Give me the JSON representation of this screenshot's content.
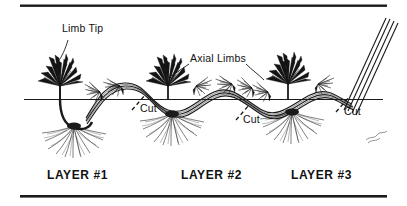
{
  "figure": {
    "background": "#ffffff",
    "ink": "#111111",
    "borders": {
      "top_rule": "horizontal-rule",
      "bottom_rule": "horizontal-rule",
      "ground_line": "soil-surface-line"
    }
  },
  "callouts": [
    {
      "id": "limb-tip",
      "text": "Limb Tip",
      "x": 62,
      "y": 28
    },
    {
      "id": "axial-limbs",
      "text": "Axial Limbs",
      "x": 190,
      "y": 58
    },
    {
      "id": "cut-1",
      "text": "Cut",
      "x": 140,
      "y": 107
    },
    {
      "id": "cut-2",
      "text": "Cut",
      "x": 243,
      "y": 118
    },
    {
      "id": "cut-3",
      "text": "Cut",
      "x": 344,
      "y": 110
    }
  ],
  "layers": [
    {
      "id": "layer-1",
      "text": "LAYER #1",
      "x": 47,
      "y": 172
    },
    {
      "id": "layer-2",
      "text": "LAYER #2",
      "x": 181,
      "y": 172
    },
    {
      "id": "layer-3",
      "text": "LAYER #3",
      "x": 291,
      "y": 172
    }
  ],
  "signature": {
    "text": "sig",
    "x": 368,
    "y": 136
  },
  "plants": [
    {
      "id": "plant-1",
      "label": "Limb Tip plant",
      "x": 60
    },
    {
      "id": "plant-2",
      "label": "Axial plant 2",
      "x": 168
    },
    {
      "id": "plant-3",
      "label": "Axial plant 3",
      "x": 288
    }
  ]
}
